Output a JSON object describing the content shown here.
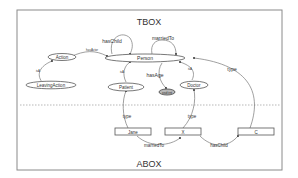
{
  "diagram": {
    "sections": {
      "tbox": "TBOX",
      "abox": "ABOX"
    },
    "tbox_nodes": [
      {
        "id": "person",
        "label": "Person",
        "shape": "ellipse"
      },
      {
        "id": "action",
        "label": "Action",
        "shape": "ellipse"
      },
      {
        "id": "leaving_action",
        "label": "LeavingAction",
        "shape": "ellipse"
      },
      {
        "id": "patient",
        "label": "Patient",
        "shape": "ellipse"
      },
      {
        "id": "doctor",
        "label": "Doctor",
        "shape": "ellipse"
      },
      {
        "id": "xsd_int",
        "label": "xsd:int",
        "shape": "ellipse",
        "fill": "#b8b8b8"
      }
    ],
    "abox_nodes": [
      {
        "id": "jane",
        "label": "Jane",
        "shape": "rect"
      },
      {
        "id": "x",
        "label": "X",
        "shape": "rect"
      },
      {
        "id": "c",
        "label": "C",
        "shape": "rect"
      }
    ],
    "edges": [
      {
        "from": "person",
        "to": "person",
        "label": "hasChild"
      },
      {
        "from": "person",
        "to": "person",
        "label": "marriedTo"
      },
      {
        "from": "action",
        "to": "person",
        "label": "hasActor"
      },
      {
        "from": "leaving_action",
        "to": "action",
        "label": "isA"
      },
      {
        "from": "patient",
        "to": "person",
        "label": "isA"
      },
      {
        "from": "doctor",
        "to": "person",
        "label": "isA"
      },
      {
        "from": "person",
        "to": "xsd_int",
        "label": "hasAge"
      },
      {
        "from": "jane",
        "to": "patient",
        "label": "type"
      },
      {
        "from": "x",
        "to": "doctor",
        "label": "type"
      },
      {
        "from": "c",
        "to": "person",
        "label": "type"
      },
      {
        "from": "jane",
        "to": "x",
        "label": "marriedTo"
      },
      {
        "from": "x",
        "to": "c",
        "label": "hasChild"
      }
    ]
  }
}
